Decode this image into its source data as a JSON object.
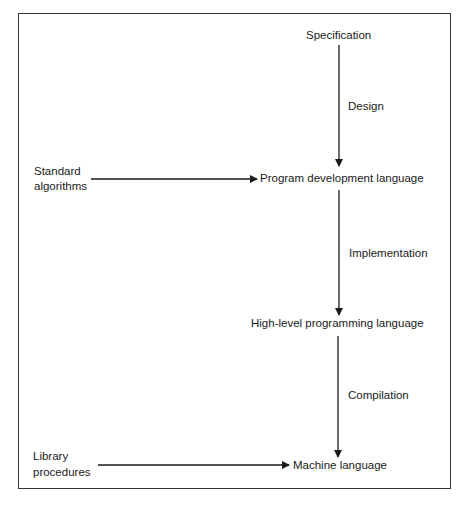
{
  "diagram": {
    "nodes": {
      "specification": "Specification",
      "program_development_language": "Program development language",
      "high_level_programming_language": "High-level programming language",
      "machine_language": "Machine language",
      "standard_algorithms_line1": "Standard",
      "standard_algorithms_line2": "algorithms",
      "library_procedures_line1": "Library",
      "library_procedures_line2": "procedures"
    },
    "edges": {
      "design": "Design",
      "implementation": "Implementation",
      "compilation": "Compilation"
    },
    "stroke_color": "#1a1a1a"
  }
}
